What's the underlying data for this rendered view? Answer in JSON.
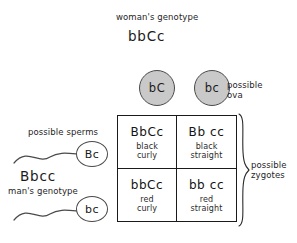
{
  "diagram": {
    "woman": {
      "label": "woman's genotype",
      "genotype": "bbCc"
    },
    "man": {
      "label": "man's genotype",
      "genotype": "Bbcc"
    },
    "ova": {
      "label": "possible\nova",
      "label_line1": "possible",
      "label_line2": "ova",
      "gametes": [
        {
          "name": "ovum-bC",
          "allele": "bC"
        },
        {
          "name": "ovum-bc",
          "allele": "bc"
        }
      ]
    },
    "sperms": {
      "label": "possible sperms",
      "gametes": [
        {
          "name": "sperm-Bc",
          "allele": "Bc"
        },
        {
          "name": "sperm-bc",
          "allele": "bc"
        }
      ]
    },
    "zygotes": {
      "label_line1": "possible",
      "label_line2": "zygotes",
      "cells": [
        {
          "name": "zygote-BbCc",
          "genotype": "BbCc",
          "phenotype_line1": "black",
          "phenotype_line2": "curly"
        },
        {
          "name": "zygote-Bbcc",
          "genotype": "Bb cc",
          "phenotype_line1": "black",
          "phenotype_line2": "straight"
        },
        {
          "name": "zygote-bbCc",
          "genotype": "bbCc",
          "phenotype_line1": "red",
          "phenotype_line2": "curly"
        },
        {
          "name": "zygote-bbcc",
          "genotype": "bb cc",
          "phenotype_line1": "red",
          "phenotype_line2": "straight"
        }
      ]
    },
    "colors": {
      "ovum_fill": "#c9c9c9",
      "sperm_fill": "#ffffff",
      "stroke": "#1a1a1a",
      "background": "#ffffff"
    }
  }
}
